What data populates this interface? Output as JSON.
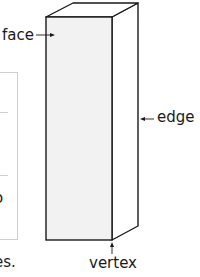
{
  "diagram": {
    "type": "rectangular prism",
    "labels": {
      "face": "face",
      "edge": "edge",
      "vertex": "vertex"
    },
    "cut_off_text": {
      "box_char": "o",
      "sentence_end": "es."
    },
    "colors": {
      "outline": "#1a1a1a",
      "front_face_fill": "#f2f2f2",
      "side_face_fill": "#ffffff",
      "box_border": "#cfcfcf"
    }
  }
}
